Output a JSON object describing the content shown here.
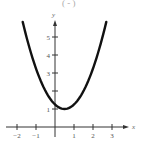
{
  "header_fragment": "( - )",
  "chart_data": {
    "type": "line",
    "title": "",
    "function": "y = (x - 0.5)^2 + 1",
    "xlabel": "x",
    "ylabel": "y",
    "xlim": [
      -2.2,
      3.6
    ],
    "ylim": [
      0,
      6.0
    ],
    "x_ticks": [
      -2,
      -1,
      0,
      1,
      2,
      3
    ],
    "x_tick_labels": [
      "−2",
      "−1",
      "1",
      "2",
      "3"
    ],
    "y_ticks": [
      1,
      2,
      3,
      4,
      5
    ],
    "y_tick_labels": [
      "1",
      "3",
      "4",
      "5"
    ],
    "grid": false,
    "legend": null,
    "series": [
      {
        "name": "parabola",
        "x": [
          -1.7,
          -1.5,
          -1.0,
          -0.5,
          0.0,
          0.5,
          1.0,
          1.5,
          2.0,
          2.5,
          2.7
        ],
        "values": [
          5.84,
          5.0,
          3.25,
          2.0,
          1.25,
          1.0,
          1.25,
          2.0,
          3.25,
          5.0,
          5.84
        ]
      }
    ],
    "vertex": [
      0.5,
      1.0
    ]
  },
  "colors": {
    "curve": "#111111",
    "axis": "#333333",
    "labels": "#555555"
  }
}
